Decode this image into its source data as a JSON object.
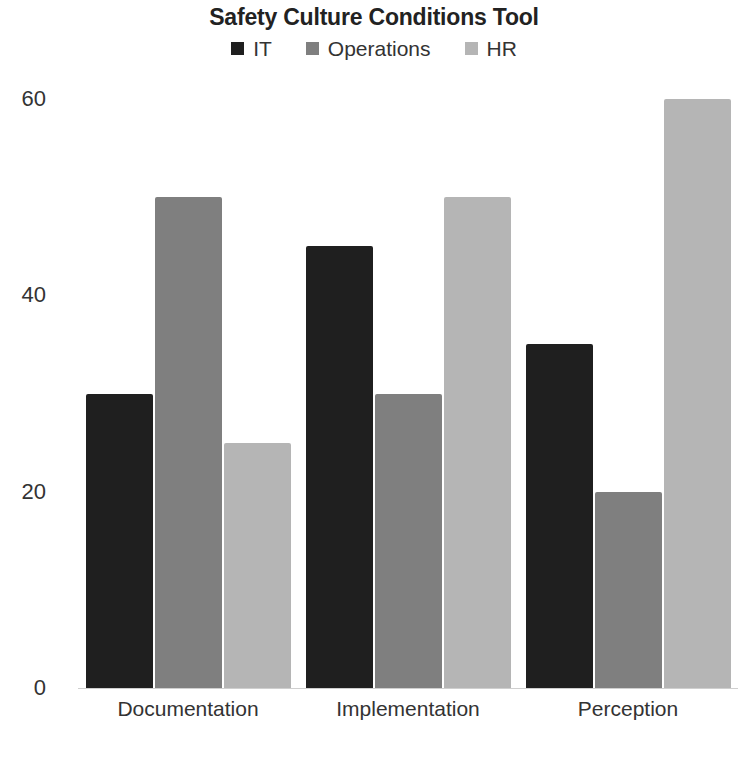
{
  "chart_data": {
    "type": "bar",
    "title": "Safety Culture Conditions Tool",
    "subtitle": "",
    "xlabel": "",
    "ylabel": "",
    "categories": [
      "Documentation",
      "Implementation",
      "Perception"
    ],
    "series": [
      {
        "name": "IT",
        "color": "#1f1f1f",
        "values": [
          30,
          45,
          35
        ]
      },
      {
        "name": "Operations",
        "color": "#7f7f7f",
        "values": [
          50,
          30,
          20
        ]
      },
      {
        "name": "HR",
        "color": "#b5b5b5",
        "values": [
          25,
          50,
          60
        ]
      }
    ],
    "ylim": [
      0,
      60
    ],
    "yticks": [
      0,
      20,
      40,
      60
    ],
    "ytick_labels": [
      "0",
      "20",
      "40",
      "60"
    ],
    "grid": false,
    "legend_position": "top-center",
    "background": "#ffffff"
  }
}
